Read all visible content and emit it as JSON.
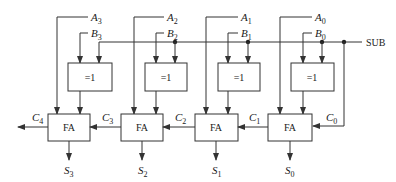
{
  "diagram": {
    "control_signal": "SUB",
    "xor_label": "=1",
    "adder_label": "FA",
    "carry_in": {
      "name": "C",
      "index": "0"
    },
    "carry_out": {
      "name": "C",
      "index": "4"
    },
    "stages": [
      {
        "a": "A",
        "a_idx": "3",
        "b": "B",
        "b_idx": "3",
        "s": "S",
        "s_idx": "3",
        "cin": "C",
        "cin_idx": "3"
      },
      {
        "a": "A",
        "a_idx": "2",
        "b": "B",
        "b_idx": "2",
        "s": "S",
        "s_idx": "2",
        "cin": "C",
        "cin_idx": "2"
      },
      {
        "a": "A",
        "a_idx": "1",
        "b": "B",
        "b_idx": "1",
        "s": "S",
        "s_idx": "1",
        "cin": "C",
        "cin_idx": "1"
      },
      {
        "a": "A",
        "a_idx": "0",
        "b": "B",
        "b_idx": "0",
        "s": "S",
        "s_idx": "0",
        "cin": "C",
        "cin_idx": "0"
      }
    ],
    "colors": {
      "line": "#333333",
      "background": "#ffffff",
      "text": "#1a1a1a"
    }
  }
}
